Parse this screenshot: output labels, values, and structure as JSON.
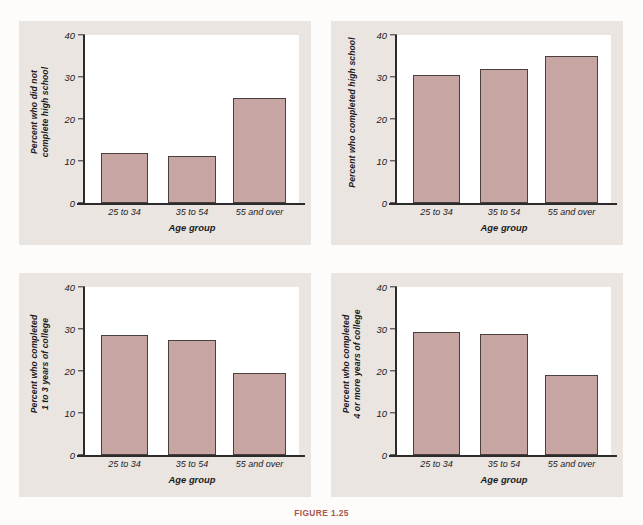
{
  "figure": {
    "caption_label": "FIGURE 1.25",
    "caption_text": "",
    "bar_color": "#c6a5a2",
    "panel_background": "#ebe5e2",
    "plot_background": "#ffffff",
    "axis_color": "#2b2b2b"
  },
  "shared": {
    "categories": [
      "25 to 34",
      "35 to 54",
      "55 and over"
    ],
    "xlabel": "Age group",
    "yticks": [
      "0",
      "10",
      "20",
      "30",
      "40"
    ],
    "ylim": [
      0,
      40
    ]
  },
  "chart_data": [
    {
      "type": "bar",
      "id": "did-not-complete-high-school",
      "title": "",
      "ylabel": "Percent who did not complete high school",
      "ylabel_lines": [
        "Percent who did not",
        "complete high school"
      ],
      "xlabel": "Age group",
      "categories": [
        "25 to 34",
        "35 to 54",
        "55 and over"
      ],
      "values": [
        11.8,
        11.2,
        24.9
      ],
      "ylim": [
        0,
        40
      ],
      "yticks": [
        0,
        10,
        20,
        30,
        40
      ],
      "grid": false,
      "legend": "none"
    },
    {
      "type": "bar",
      "id": "completed-high-school",
      "title": "",
      "ylabel": "Percent who completed high school",
      "ylabel_lines": [
        "Percent who completed high school"
      ],
      "xlabel": "Age group",
      "categories": [
        "25 to 34",
        "35 to 54",
        "55 and over"
      ],
      "values": [
        30.5,
        32.0,
        35.1
      ],
      "ylim": [
        0,
        40
      ],
      "yticks": [
        0,
        10,
        20,
        30,
        40
      ],
      "grid": false,
      "legend": "none"
    },
    {
      "type": "bar",
      "id": "completed-1-to-3-years-college",
      "title": "",
      "ylabel": "Percent who completed 1 to 3 years of college",
      "ylabel_lines": [
        "Percent who completed",
        "1 to 3 years of college"
      ],
      "xlabel": "Age group",
      "categories": [
        "25 to 34",
        "35 to 54",
        "55 and over"
      ],
      "values": [
        28.5,
        27.3,
        19.5
      ],
      "ylim": [
        0,
        40
      ],
      "yticks": [
        0,
        10,
        20,
        30,
        40
      ],
      "grid": false,
      "legend": "none"
    },
    {
      "type": "bar",
      "id": "completed-4-or-more-years-college",
      "title": "",
      "ylabel": "Percent who completed 4 or more years of college",
      "ylabel_lines": [
        "Percent who completed",
        "4 or more years of college"
      ],
      "xlabel": "Age group",
      "categories": [
        "25 to 34",
        "35 to 54",
        "55 and over"
      ],
      "values": [
        29.4,
        28.7,
        19.0
      ],
      "ylim": [
        0,
        40
      ],
      "yticks": [
        0,
        10,
        20,
        30,
        40
      ],
      "grid": false,
      "legend": "none"
    }
  ]
}
